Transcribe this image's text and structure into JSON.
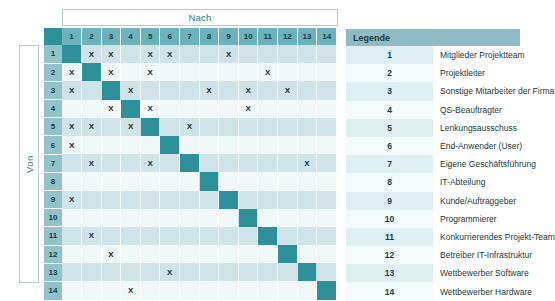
{
  "axes": {
    "columns_label": "Nach",
    "rows_label": "Von"
  },
  "matrix": {
    "column_headers": [
      "1",
      "2",
      "3",
      "4",
      "5",
      "6",
      "7",
      "8",
      "9",
      "10",
      "11",
      "12",
      "13",
      "14"
    ],
    "row_headers": [
      "1",
      "2",
      "3",
      "4",
      "5",
      "6",
      "7",
      "8",
      "9",
      "10",
      "11",
      "12",
      "13",
      "14"
    ],
    "mark": "X",
    "rows": [
      {
        "id": "1",
        "marks": [
          2,
          3,
          5,
          6,
          9
        ]
      },
      {
        "id": "2",
        "marks": [
          1,
          3,
          5,
          11
        ]
      },
      {
        "id": "3",
        "marks": [
          1,
          4,
          8,
          10,
          12
        ]
      },
      {
        "id": "4",
        "marks": [
          3,
          5,
          10
        ]
      },
      {
        "id": "5",
        "marks": [
          1,
          2,
          4,
          7
        ]
      },
      {
        "id": "6",
        "marks": [
          1
        ]
      },
      {
        "id": "7",
        "marks": [
          2,
          5,
          13
        ]
      },
      {
        "id": "8",
        "marks": []
      },
      {
        "id": "9",
        "marks": [
          1
        ]
      },
      {
        "id": "10",
        "marks": []
      },
      {
        "id": "11",
        "marks": [
          2
        ]
      },
      {
        "id": "12",
        "marks": [
          3
        ]
      },
      {
        "id": "13",
        "marks": [
          6
        ]
      },
      {
        "id": "14",
        "marks": [
          4
        ]
      }
    ]
  },
  "legend": {
    "title": "Legende",
    "items": [
      {
        "num": "1",
        "label": "Mitglieder Projektteam"
      },
      {
        "num": "2",
        "label": "Projektleiter"
      },
      {
        "num": "3",
        "label": "Sonstige Mitarbeiter der Firma"
      },
      {
        "num": "4",
        "label": "QS-Beauftragter"
      },
      {
        "num": "5",
        "label": "Lenkungsausschuss"
      },
      {
        "num": "6",
        "label": "End-Anwender (User)"
      },
      {
        "num": "7",
        "label": "Eigene Geschäftsführung"
      },
      {
        "num": "8",
        "label": "IT-Abteilung"
      },
      {
        "num": "9",
        "label": "Kunde/Auftraggeber"
      },
      {
        "num": "10",
        "label": "Programmierer"
      },
      {
        "num": "11",
        "label": "Konkurrierendes Projekt-Team"
      },
      {
        "num": "12",
        "label": "Betreiber IT-Infrastruktur"
      },
      {
        "num": "13",
        "label": "Wettbewerber Software"
      },
      {
        "num": "14",
        "label": "Wettbewerber Hardware"
      }
    ]
  },
  "colors": {
    "accent_dark": "#2e9199",
    "header_teal": "#6cb2bb",
    "rowhead_teal": "#93c3ca",
    "legend_head": "#8fbcc4",
    "stripe_dark": "#cfe3e8",
    "stripe_light": "#f1f8fa"
  }
}
